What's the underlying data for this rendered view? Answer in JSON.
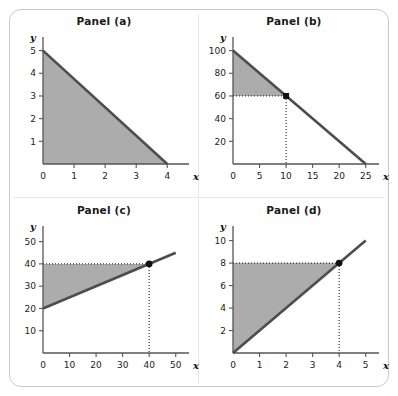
{
  "figure": {
    "background_color": "#ffffff",
    "frame_color": "#c9c9c9",
    "line_color": "#4d4d4d",
    "shade_color": "#a8a8a8",
    "marker_color": "#111111",
    "axis_color": "#555555",
    "dotted_color": "#333333"
  },
  "panels": [
    {
      "id": "panel-a",
      "title": "Panel (a)",
      "xlabel": "x",
      "ylabel": "y",
      "xticks": [
        0,
        1,
        2,
        3,
        4
      ],
      "yticks": [
        1,
        2,
        3,
        4,
        5
      ],
      "xlim": [
        0,
        4.7
      ],
      "ylim": [
        0,
        5.6
      ],
      "line": {
        "x1": 0,
        "y1": 5,
        "x2": 4,
        "y2": 0
      },
      "shade": "below",
      "marker": null,
      "dotted": []
    },
    {
      "id": "panel-b",
      "title": "Panel (b)",
      "xlabel": "x",
      "ylabel": "y",
      "xticks": [
        0,
        5,
        10,
        15,
        20,
        25
      ],
      "yticks": [
        20,
        40,
        60,
        80,
        100
      ],
      "xlim": [
        0,
        27.5
      ],
      "ylim": [
        0,
        112
      ],
      "line": {
        "x1": 0,
        "y1": 100,
        "x2": 25,
        "y2": 0
      },
      "shade": "above-to-marker",
      "marker": {
        "x": 10,
        "y": 60,
        "shape": "square"
      },
      "dotted": [
        "to-y-axis",
        "to-x-axis"
      ]
    },
    {
      "id": "panel-c",
      "title": "Panel (c)",
      "xlabel": "x",
      "ylabel": "y",
      "xticks": [
        0,
        10,
        20,
        30,
        40,
        50
      ],
      "yticks": [
        10,
        20,
        30,
        40,
        50
      ],
      "xlim": [
        0,
        55
      ],
      "ylim": [
        0,
        57
      ],
      "line": {
        "x1": 0,
        "y1": 20,
        "x2": 50,
        "y2": 45
      },
      "shade": "above-to-marker",
      "marker": {
        "x": 40,
        "y": 40,
        "shape": "circle"
      },
      "dotted": [
        "to-y-axis",
        "to-x-axis"
      ]
    },
    {
      "id": "panel-d",
      "title": "Panel (d)",
      "xlabel": "x",
      "ylabel": "y",
      "xticks": [
        0,
        1,
        2,
        3,
        4,
        5
      ],
      "yticks": [
        2,
        4,
        6,
        8,
        10
      ],
      "xlim": [
        0,
        5.5
      ],
      "ylim": [
        0,
        11.3
      ],
      "line": {
        "x1": 0,
        "y1": 0,
        "x2": 5,
        "y2": 10
      },
      "shade": "above-to-marker",
      "marker": {
        "x": 4,
        "y": 8,
        "shape": "circle"
      },
      "dotted": [
        "to-y-axis",
        "to-x-axis"
      ]
    }
  ],
  "chart_data": {
    "type": "line",
    "panels": [
      {
        "name": "Panel (a)",
        "xlabel": "x",
        "ylabel": "y",
        "x_tick_labels": [
          "0",
          "1",
          "2",
          "3",
          "4"
        ],
        "y_tick_labels": [
          "1",
          "2",
          "3",
          "4",
          "5"
        ],
        "xlim": [
          0,
          4.7
        ],
        "ylim": [
          0,
          5.6
        ],
        "series": [
          {
            "name": "line",
            "x": [
              0,
              4
            ],
            "y": [
              5,
              0
            ],
            "intercept": 5,
            "slope": -1.25
          }
        ],
        "shaded_region": {
          "description": "triangle below the line bounded by both axes",
          "vertices": [
            [
              0,
              0
            ],
            [
              0,
              5
            ],
            [
              4,
              0
            ]
          ]
        },
        "annotations": [],
        "grid": false,
        "legend": "none"
      },
      {
        "name": "Panel (b)",
        "xlabel": "x",
        "ylabel": "y",
        "x_tick_labels": [
          "0",
          "5",
          "10",
          "15",
          "20",
          "25"
        ],
        "y_tick_labels": [
          "20",
          "40",
          "60",
          "80",
          "100"
        ],
        "xlim": [
          0,
          27.5
        ],
        "ylim": [
          0,
          112
        ],
        "series": [
          {
            "name": "line",
            "x": [
              0,
              25
            ],
            "y": [
              100,
              0
            ],
            "intercept": 100,
            "slope": -4
          }
        ],
        "shaded_region": {
          "description": "triangle between the line, the y-axis and the horizontal y=60 level",
          "vertices": [
            [
              0,
              60
            ],
            [
              0,
              100
            ],
            [
              10,
              60
            ]
          ]
        },
        "annotations": [
          {
            "type": "point",
            "x": 10,
            "y": 60,
            "marker": "square"
          },
          {
            "type": "dotted-guide",
            "from": [
              0,
              60
            ],
            "to": [
              10,
              60
            ]
          },
          {
            "type": "dotted-guide",
            "from": [
              10,
              60
            ],
            "to": [
              10,
              0
            ]
          }
        ],
        "grid": false,
        "legend": "none"
      },
      {
        "name": "Panel (c)",
        "xlabel": "x",
        "ylabel": "y",
        "x_tick_labels": [
          "0",
          "10",
          "20",
          "30",
          "40",
          "50"
        ],
        "y_tick_labels": [
          "10",
          "20",
          "30",
          "40",
          "50"
        ],
        "xlim": [
          0,
          55
        ],
        "ylim": [
          0,
          57
        ],
        "series": [
          {
            "name": "line",
            "x": [
              0,
              50
            ],
            "y": [
              20,
              45
            ],
            "intercept": 20,
            "slope": 0.5
          }
        ],
        "shaded_region": {
          "description": "triangle between the line, the y-axis and the horizontal y=40 level",
          "vertices": [
            [
              0,
              20
            ],
            [
              0,
              40
            ],
            [
              40,
              40
            ]
          ]
        },
        "annotations": [
          {
            "type": "point",
            "x": 40,
            "y": 40,
            "marker": "circle"
          },
          {
            "type": "dotted-guide",
            "from": [
              0,
              40
            ],
            "to": [
              40,
              40
            ]
          },
          {
            "type": "dotted-guide",
            "from": [
              40,
              40
            ],
            "to": [
              40,
              0
            ]
          }
        ],
        "grid": false,
        "legend": "none"
      },
      {
        "name": "Panel (d)",
        "xlabel": "x",
        "ylabel": "y",
        "x_tick_labels": [
          "0",
          "1",
          "2",
          "3",
          "4",
          "5"
        ],
        "y_tick_labels": [
          "2",
          "4",
          "6",
          "8",
          "10"
        ],
        "xlim": [
          0,
          5.5
        ],
        "ylim": [
          0,
          11.3
        ],
        "series": [
          {
            "name": "line",
            "x": [
              0,
              5
            ],
            "y": [
              0,
              10
            ],
            "intercept": 0,
            "slope": 2
          }
        ],
        "shaded_region": {
          "description": "triangle between the line, the y-axis and the horizontal y=8 level",
          "vertices": [
            [
              0,
              0
            ],
            [
              0,
              8
            ],
            [
              4,
              8
            ]
          ]
        },
        "annotations": [
          {
            "type": "point",
            "x": 4,
            "y": 8,
            "marker": "circle"
          },
          {
            "type": "dotted-guide",
            "from": [
              0,
              8
            ],
            "to": [
              4,
              8
            ]
          },
          {
            "type": "dotted-guide",
            "from": [
              4,
              8
            ],
            "to": [
              4,
              0
            ]
          }
        ],
        "grid": false,
        "legend": "none"
      }
    ]
  }
}
